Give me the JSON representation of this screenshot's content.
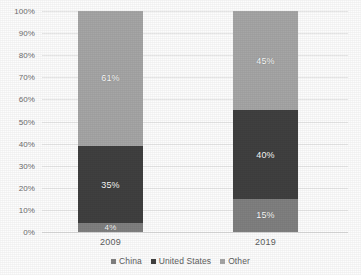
{
  "chart_data": {
    "type": "bar",
    "stacked": true,
    "percent_stacked": true,
    "title": "",
    "subtitle": "",
    "xlabel": "",
    "ylabel": "",
    "categories": [
      "2009",
      "2019"
    ],
    "ylim": [
      0,
      100
    ],
    "ytick_labels": [
      "100%",
      "90%",
      "80%",
      "70%",
      "60%",
      "50%",
      "40%",
      "30%",
      "20%",
      "10%",
      "0%"
    ],
    "ytick_values": [
      100,
      90,
      80,
      70,
      60,
      50,
      40,
      30,
      20,
      10,
      0
    ],
    "grid": true,
    "legend_position": "bottom",
    "series": [
      {
        "name": "China",
        "color": "#808080",
        "values": [
          4,
          15
        ],
        "data_labels": [
          "4%",
          "15%"
        ]
      },
      {
        "name": "United States",
        "color": "#404040",
        "values": [
          35,
          40
        ],
        "data_labels": [
          "35%",
          "40%"
        ]
      },
      {
        "name": "Other",
        "color": "#a6a6a6",
        "values": [
          61,
          45
        ],
        "data_labels": [
          "61%",
          "45%"
        ]
      }
    ]
  },
  "legend": {
    "items": [
      {
        "label": "China",
        "color": "#808080"
      },
      {
        "label": "United States",
        "color": "#404040"
      },
      {
        "label": "Other",
        "color": "#a6a6a6"
      }
    ]
  },
  "colors": {
    "china": "#808080",
    "united_states": "#404040",
    "other": "#a6a6a6",
    "gridline": "#e8e8e8",
    "axis_text": "#6e6e6e",
    "background": "#fdfdfd"
  }
}
